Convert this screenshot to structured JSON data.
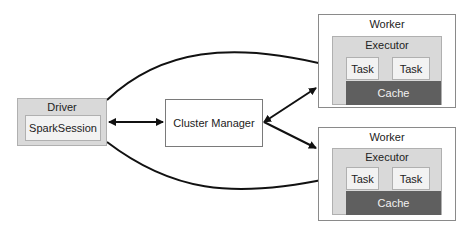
{
  "driver": {
    "title": "Driver",
    "session": "SparkSession"
  },
  "cluster_manager": {
    "label": "Cluster Manager"
  },
  "workers": [
    {
      "title": "Worker",
      "executor": {
        "title": "Executor",
        "tasks": [
          "Task",
          "Task"
        ],
        "cache": "Cache"
      }
    },
    {
      "title": "Worker",
      "executor": {
        "title": "Executor",
        "tasks": [
          "Task",
          "Task"
        ],
        "cache": "Cache"
      }
    }
  ],
  "colors": {
    "driver_fill": "#d9d9d9",
    "executor_fill": "#d9d9d9",
    "task_fill": "#f2f2f2",
    "cache_fill": "#5f5f5f",
    "arrow": "#111111"
  }
}
